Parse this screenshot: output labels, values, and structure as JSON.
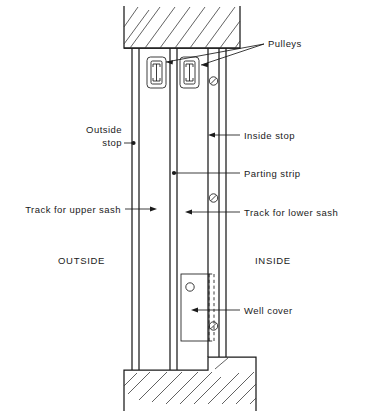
{
  "diagram": {
    "type": "architectural-section",
    "colors": {
      "line": "#1a1a1a",
      "hatch": "#3a3a3a",
      "background": "#ffffff"
    },
    "labels": {
      "pulleys": "Pulleys",
      "outside_stop_line1": "Outside",
      "outside_stop_line2": "stop",
      "inside_stop": "Inside stop",
      "parting_strip": "Parting strip",
      "track_upper_sash": "Track for upper sash",
      "track_lower_sash": "Track for lower sash",
      "outside": "OUTSIDE",
      "inside": "INSIDE",
      "well_cover": "Well cover"
    },
    "components": [
      {
        "name": "header",
        "label": "Head jamb / header",
        "hatched": true
      },
      {
        "name": "sill",
        "label": "Sill",
        "hatched": true
      },
      {
        "name": "pulley-upper-sash",
        "label": "Pulley for upper sash"
      },
      {
        "name": "pulley-lower-sash",
        "label": "Pulley for lower sash"
      },
      {
        "name": "well-cover",
        "label": "Well cover"
      },
      {
        "name": "screw-top",
        "label": "Screw"
      },
      {
        "name": "screw-middle",
        "label": "Screw"
      },
      {
        "name": "screw-bottom",
        "label": "Screw"
      }
    ]
  }
}
